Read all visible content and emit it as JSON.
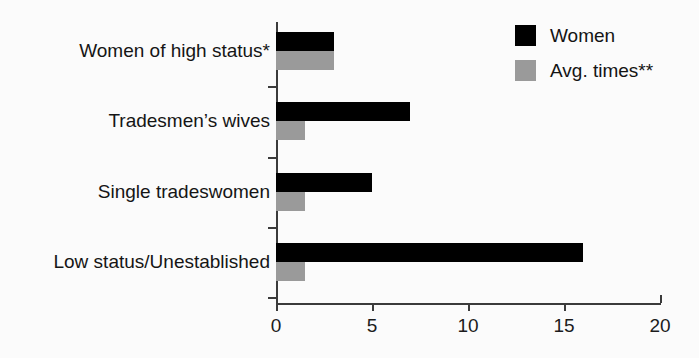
{
  "chart_data": {
    "type": "bar",
    "orientation": "horizontal",
    "title": "",
    "xlabel": "",
    "ylabel": "",
    "xlim": [
      0,
      20
    ],
    "xticks": [
      "0",
      "5",
      "10",
      "15",
      "20"
    ],
    "grid": false,
    "legend_position": "top-right",
    "categories": [
      "Women of high status*",
      "Tradesmen’s wives",
      "Single tradeswomen",
      "Low status/Unestablished"
    ],
    "series": [
      {
        "name": "Women",
        "color": "#000000",
        "values": [
          3,
          7,
          5,
          16
        ]
      },
      {
        "name": "Avg. times**",
        "color": "#9a9a9a",
        "values": [
          3,
          1.5,
          1.5,
          1.5
        ]
      }
    ]
  },
  "legend": {
    "items": [
      {
        "label": "Women",
        "swatch": "black-square-swatch"
      },
      {
        "label": "Avg. times**",
        "swatch": "gray-square-swatch"
      }
    ]
  },
  "axis": {
    "x_tick_labels": [
      "0",
      "5",
      "10",
      "15",
      "20"
    ]
  },
  "colors": {
    "women": "#000000",
    "avg_times": "#9a9a9a",
    "axis": "#3b3b3b",
    "background": "#fbfbfb",
    "text": "#151515"
  }
}
